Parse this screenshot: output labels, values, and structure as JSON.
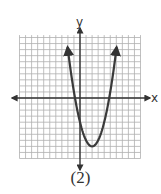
{
  "chart_data": {
    "type": "line",
    "title": "",
    "caption": "(2)",
    "xlabel": "x",
    "ylabel": "y",
    "xlim": [
      -10,
      10
    ],
    "ylim": [
      -10,
      10
    ],
    "grid": true,
    "legend": null,
    "series": [
      {
        "name": "parabola",
        "equation": "y = (x - 2)^2 - 8",
        "vertex": [
          2,
          -8
        ],
        "x_intercepts": [
          -0.8,
          4.8
        ],
        "opens": "up",
        "x": [
          -2,
          -1,
          0,
          1,
          2,
          3,
          4,
          5,
          6
        ],
        "values": [
          8,
          1,
          -4,
          -7,
          -8,
          -7,
          -4,
          1,
          8
        ]
      }
    ]
  },
  "colors": {
    "grid": "#b0b0b0",
    "axis": "#333333",
    "curve": "#3a3a3a",
    "text": "#333333"
  }
}
